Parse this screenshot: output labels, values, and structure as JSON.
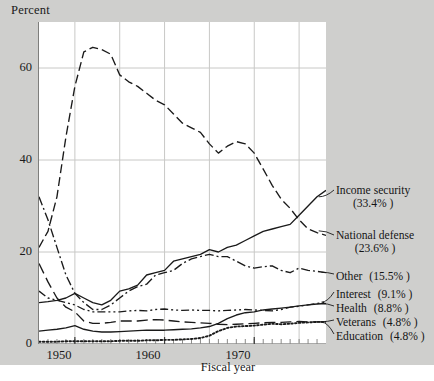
{
  "figure": {
    "ylabel": "Percent",
    "xlabel": "Fiscal year",
    "background_color": "#cfcfcd",
    "panel_color": "#ffffff",
    "grid_color": "#c8c8c6",
    "line_color": "#1a1a1a"
  },
  "chart_data": {
    "type": "line",
    "title": "",
    "xlabel": "Fiscal year",
    "ylabel": "Percent",
    "xlim": [
      1946,
      1978
    ],
    "ylim": [
      0,
      70
    ],
    "xticks": [
      1950,
      1960,
      1970
    ],
    "yticks": [
      0,
      20,
      40,
      60
    ],
    "grid": true,
    "legend_position": "right-outside",
    "x": [
      1946,
      1947,
      1948,
      1949,
      1950,
      1951,
      1952,
      1953,
      1954,
      1955,
      1956,
      1957,
      1958,
      1959,
      1960,
      1961,
      1962,
      1963,
      1964,
      1965,
      1966,
      1967,
      1968,
      1969,
      1970,
      1971,
      1972,
      1973,
      1974,
      1975,
      1976,
      1977,
      1978
    ],
    "series": [
      {
        "name": "National defense",
        "label": "National defense",
        "percent_label": "(23.6% )",
        "value": 23.6,
        "linestyle": "dashed",
        "values": [
          21.0,
          24.5,
          32.0,
          45.0,
          56.0,
          63.5,
          64.5,
          64.0,
          63.0,
          58.5,
          57.0,
          56.0,
          54.5,
          53.0,
          52.0,
          50.0,
          48.0,
          47.0,
          46.0,
          43.5,
          41.5,
          43.0,
          44.0,
          43.5,
          41.5,
          38.0,
          34.5,
          31.5,
          29.5,
          27.0,
          25.0,
          24.2,
          23.6
        ]
      },
      {
        "name": "Income security",
        "label": "Income security",
        "percent_label": "(33.4% )",
        "value": 33.4,
        "linestyle": "solid",
        "values": [
          9.0,
          9.2,
          9.5,
          10.0,
          11.0,
          10.0,
          9.0,
          8.5,
          9.5,
          11.5,
          12.0,
          12.8,
          15.0,
          15.5,
          16.0,
          18.0,
          18.5,
          19.0,
          19.5,
          20.5,
          20.0,
          21.0,
          21.5,
          22.5,
          23.5,
          24.5,
          25.0,
          25.5,
          26.0,
          28.0,
          30.0,
          32.0,
          33.4
        ]
      },
      {
        "name": "Other",
        "label": "Other",
        "percent_label": "(15.5% )",
        "value": 15.5,
        "linestyle": "dashdot",
        "values": [
          32.0,
          27.0,
          21.0,
          15.0,
          11.0,
          9.0,
          7.5,
          7.5,
          8.5,
          10.0,
          11.5,
          12.5,
          13.0,
          15.0,
          15.5,
          16.0,
          17.5,
          18.5,
          19.0,
          19.5,
          19.0,
          19.0,
          18.0,
          17.0,
          16.5,
          16.8,
          17.0,
          16.0,
          15.5,
          16.5,
          16.0,
          15.8,
          15.5
        ]
      },
      {
        "name": "Interest",
        "label": "Interest",
        "percent_label": "(9.1% )",
        "value": 9.1,
        "linestyle": "dashdotdot",
        "values": [
          11.5,
          10.0,
          9.5,
          9.0,
          8.5,
          7.5,
          7.0,
          7.0,
          7.0,
          7.0,
          7.2,
          7.3,
          7.2,
          7.5,
          7.6,
          7.4,
          7.3,
          7.4,
          7.3,
          7.3,
          7.2,
          7.3,
          7.4,
          7.5,
          7.4,
          7.3,
          7.2,
          7.5,
          8.0,
          8.2,
          8.5,
          8.8,
          9.1
        ]
      },
      {
        "name": "Health",
        "label": "Health",
        "percent_label": "(8.8% )",
        "value": 8.8,
        "linestyle": "solid",
        "values": [
          2.8,
          3.0,
          3.2,
          3.5,
          4.0,
          3.2,
          2.8,
          2.6,
          2.6,
          2.7,
          2.8,
          2.9,
          3.0,
          3.0,
          3.0,
          3.1,
          3.2,
          3.3,
          3.5,
          3.8,
          4.5,
          5.5,
          6.3,
          6.8,
          7.0,
          7.4,
          7.6,
          7.8,
          8.0,
          8.3,
          8.5,
          8.7,
          8.8
        ]
      },
      {
        "name": "Veterans",
        "label": "Veterans",
        "percent_label": "(4.8% )",
        "value": 4.8,
        "linestyle": "longdash",
        "values": [
          17.5,
          13.5,
          10.0,
          8.0,
          7.0,
          5.0,
          4.5,
          4.5,
          4.7,
          5.0,
          5.0,
          5.0,
          5.2,
          5.3,
          5.2,
          5.0,
          4.8,
          4.7,
          4.6,
          4.5,
          4.3,
          4.2,
          4.3,
          4.4,
          4.5,
          4.6,
          4.7,
          4.7,
          4.8,
          4.9,
          4.8,
          4.8,
          4.8
        ]
      },
      {
        "name": "Education",
        "label": "Education",
        "percent_label": "(4.8% )",
        "value": 4.8,
        "linestyle": "dotted",
        "values": [
          0.5,
          0.5,
          0.5,
          0.6,
          0.6,
          0.6,
          0.6,
          0.6,
          0.6,
          0.7,
          0.7,
          0.7,
          0.8,
          0.8,
          0.9,
          0.9,
          1.0,
          1.1,
          1.3,
          1.8,
          2.8,
          3.5,
          3.8,
          3.9,
          4.0,
          4.2,
          4.4,
          4.3,
          4.4,
          4.6,
          4.7,
          4.8,
          4.8
        ]
      }
    ]
  },
  "ytick_labels": [
    "0",
    "20",
    "40",
    "60"
  ],
  "xtick_labels": [
    "1950",
    "1960",
    "1970"
  ],
  "legend": [
    {
      "label": "Income security",
      "percent": "(33.4% )",
      "two_line": true
    },
    {
      "label": "National defense",
      "percent": "(23.6% )",
      "two_line": true
    },
    {
      "label": "Other",
      "percent": "(15.5% )",
      "two_line": false
    },
    {
      "label": "Interest",
      "percent": "(9.1% )",
      "two_line": false
    },
    {
      "label": "Health",
      "percent": "(8.8% )",
      "two_line": false
    },
    {
      "label": "Veterans",
      "percent": "(4.8% )",
      "two_line": false
    },
    {
      "label": "Education",
      "percent": "(4.8% )",
      "two_line": false
    }
  ]
}
